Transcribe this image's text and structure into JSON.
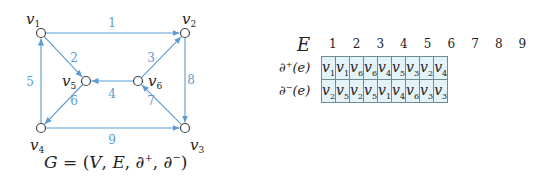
{
  "graph": {
    "nodes": [
      {
        "id": "v1",
        "base": "v",
        "sub": "1",
        "x": 41,
        "y": 33,
        "lx": 26,
        "ly": 24
      },
      {
        "id": "v2",
        "base": "v",
        "sub": "2",
        "x": 185,
        "y": 33,
        "lx": 182,
        "ly": 24
      },
      {
        "id": "v3",
        "base": "v",
        "sub": "3",
        "x": 185,
        "y": 128,
        "lx": 190,
        "ly": 150
      },
      {
        "id": "v4",
        "base": "v",
        "sub": "4",
        "x": 41,
        "y": 128,
        "lx": 30,
        "ly": 150
      },
      {
        "id": "v5",
        "base": "v",
        "sub": "5",
        "x": 86,
        "y": 81,
        "lx": 62,
        "ly": 86
      },
      {
        "id": "v6",
        "base": "v",
        "sub": "6",
        "x": 138,
        "y": 81,
        "lx": 148,
        "ly": 86
      }
    ],
    "edges": [
      {
        "label": "1",
        "from": "v1",
        "to": "v2",
        "lx": 112,
        "ly": 27
      },
      {
        "label": "2",
        "from": "v1",
        "to": "v5",
        "lx": 74,
        "ly": 62
      },
      {
        "label": "3",
        "from": "v6",
        "to": "v2",
        "lx": 151,
        "ly": 62
      },
      {
        "label": "4",
        "from": "v6",
        "to": "v5",
        "lx": 112,
        "ly": 98
      },
      {
        "label": "5",
        "from": "v4",
        "to": "v1",
        "lx": 30,
        "ly": 86
      },
      {
        "label": "6",
        "from": "v5",
        "to": "v4",
        "lx": 74,
        "ly": 105
      },
      {
        "label": "7",
        "from": "v3",
        "to": "v6",
        "lx": 151,
        "ly": 105
      },
      {
        "label": "8",
        "from": "v2",
        "to": "v3",
        "lx": 191,
        "ly": 84
      },
      {
        "label": "9",
        "from": "v4",
        "to": "v3",
        "lx": 112,
        "ly": 144
      }
    ],
    "edge_color": "#5b9bd0",
    "node_stroke": "#444444"
  },
  "formula": {
    "G": "G",
    "eq": " = (",
    "V": "V",
    "sep1": ", ",
    "E": "E",
    "sep2": ", ∂",
    "plus": "+",
    "sep3": ", ∂",
    "minus": "−",
    "close": ")"
  },
  "table": {
    "header_symbol": "E",
    "columns": [
      "1",
      "2",
      "3",
      "4",
      "5",
      "6",
      "7",
      "8",
      "9"
    ],
    "row_labels": [
      {
        "d": "∂",
        "sign": "+",
        "arg": "(e)"
      },
      {
        "d": "∂",
        "sign": "−",
        "arg": "(e)"
      }
    ],
    "rows": [
      [
        {
          "b": "v",
          "s": "1"
        },
        {
          "b": "v",
          "s": "1"
        },
        {
          "b": "v",
          "s": "6"
        },
        {
          "b": "v",
          "s": "6"
        },
        {
          "b": "v",
          "s": "4"
        },
        {
          "b": "v",
          "s": "5"
        },
        {
          "b": "v",
          "s": "3"
        },
        {
          "b": "v",
          "s": "2"
        },
        {
          "b": "v",
          "s": "4"
        }
      ],
      [
        {
          "b": "v",
          "s": "2"
        },
        {
          "b": "v",
          "s": "5"
        },
        {
          "b": "v",
          "s": "2"
        },
        {
          "b": "v",
          "s": "5"
        },
        {
          "b": "v",
          "s": "1"
        },
        {
          "b": "v",
          "s": "4"
        },
        {
          "b": "v",
          "s": "6"
        },
        {
          "b": "v",
          "s": "3"
        },
        {
          "b": "v",
          "s": "3"
        }
      ]
    ],
    "cell_bg": "#e4f3f7",
    "border_color": "#6f8c92"
  }
}
